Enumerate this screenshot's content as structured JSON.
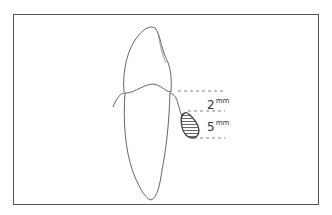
{
  "diagram": {
    "measurements": [
      {
        "value": "2",
        "unit": "mm"
      },
      {
        "value": "5",
        "unit": "mm"
      }
    ],
    "colors": {
      "line": "#555555",
      "frame": "#555555",
      "background": "#ffffff"
    }
  }
}
